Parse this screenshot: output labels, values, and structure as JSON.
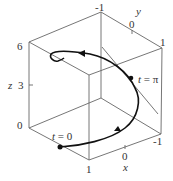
{
  "figure": {
    "type": "3d-parametric-curve",
    "colors": {
      "box": "#666666",
      "curve": "#111111",
      "text": "#333333",
      "background": "#ffffff"
    },
    "axes": {
      "z": {
        "label": "z",
        "ticks": [
          "0",
          "3",
          "6"
        ]
      },
      "y": {
        "label": "y",
        "ticks": [
          "-1",
          "0",
          "1"
        ]
      },
      "x": {
        "label": "x",
        "ticks": [
          "1",
          "0",
          "-1"
        ]
      }
    },
    "annotations": {
      "start": {
        "t": "t",
        "eq": " = 0"
      },
      "mid": {
        "t": "t",
        "eq": " = π"
      }
    }
  }
}
